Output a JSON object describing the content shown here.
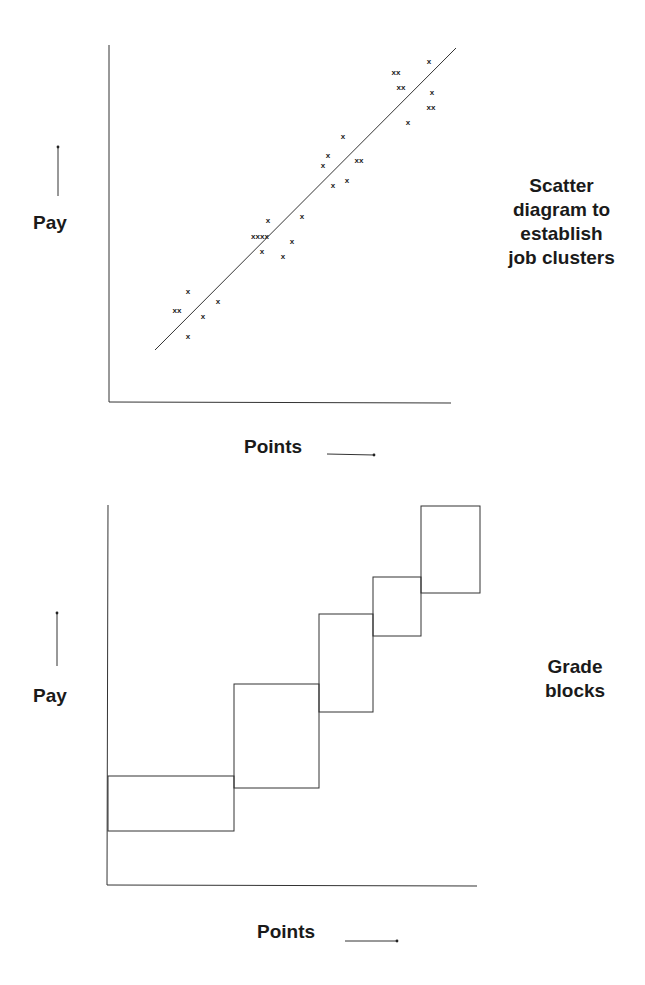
{
  "top_figure": {
    "caption_lines": [
      "Scatter",
      "diagram to",
      "establish",
      "job clusters"
    ],
    "y_label": "Pay",
    "x_label": "Points"
  },
  "bottom_figure": {
    "caption_lines": [
      "Grade",
      "blocks"
    ],
    "y_label": "Pay",
    "x_label": "Points"
  },
  "colors": {
    "line": "#333333",
    "text": "#1a1a1a",
    "background": "#ffffff"
  },
  "chart_data": [
    {
      "type": "scatter",
      "title": "Scatter diagram to establish job clusters",
      "xlabel": "Points",
      "ylabel": "Pay",
      "grid": false,
      "ticks": "none",
      "markers": [
        {
          "x": 177,
          "y": 310,
          "label": "xx"
        },
        {
          "x": 188,
          "y": 291,
          "label": "x"
        },
        {
          "x": 188,
          "y": 336,
          "label": "x"
        },
        {
          "x": 203,
          "y": 316,
          "label": "x"
        },
        {
          "x": 218,
          "y": 301,
          "label": "x"
        },
        {
          "x": 260,
          "y": 236,
          "label": "xxxx"
        },
        {
          "x": 268,
          "y": 220,
          "label": "x"
        },
        {
          "x": 262,
          "y": 251,
          "label": "x"
        },
        {
          "x": 283,
          "y": 256,
          "label": "x"
        },
        {
          "x": 292,
          "y": 241,
          "label": "x"
        },
        {
          "x": 302,
          "y": 216,
          "label": "x"
        },
        {
          "x": 323,
          "y": 165,
          "label": "x"
        },
        {
          "x": 328,
          "y": 155,
          "label": "x"
        },
        {
          "x": 333,
          "y": 185,
          "label": "x"
        },
        {
          "x": 343,
          "y": 136,
          "label": "x"
        },
        {
          "x": 347,
          "y": 180,
          "label": "x"
        },
        {
          "x": 359,
          "y": 160,
          "label": "xx"
        },
        {
          "x": 396,
          "y": 72,
          "label": "xx"
        },
        {
          "x": 401,
          "y": 87,
          "label": "xx"
        },
        {
          "x": 429,
          "y": 61,
          "label": "x"
        },
        {
          "x": 432,
          "y": 92,
          "label": "x"
        },
        {
          "x": 431,
          "y": 107,
          "label": "xx"
        },
        {
          "x": 408,
          "y": 122,
          "label": "x"
        }
      ],
      "trend_line": {
        "x1": 155,
        "y1": 350,
        "x2": 456,
        "y2": 48
      },
      "axes": {
        "origin": [
          109,
          402
        ],
        "y_top": 45,
        "x_end": 451
      }
    },
    {
      "type": "diagram",
      "title": "Grade blocks",
      "xlabel": "Points",
      "ylabel": "Pay",
      "grid": false,
      "blocks": [
        {
          "grade": 1,
          "x0": 108,
          "x1": 234,
          "y_top": 776,
          "y_bottom": 831
        },
        {
          "grade": 2,
          "x0": 234,
          "x1": 319,
          "y_top": 684,
          "y_bottom": 788
        },
        {
          "grade": 3,
          "x0": 319,
          "x1": 373,
          "y_top": 614,
          "y_bottom": 712
        },
        {
          "grade": 4,
          "x0": 373,
          "x1": 421,
          "y_top": 577,
          "y_bottom": 636
        },
        {
          "grade": 5,
          "x0": 421,
          "x1": 480,
          "y_top": 506,
          "y_bottom": 593
        }
      ],
      "axes": {
        "origin": [
          108,
          885
        ],
        "y_top": 505,
        "x_end": 477
      }
    }
  ]
}
